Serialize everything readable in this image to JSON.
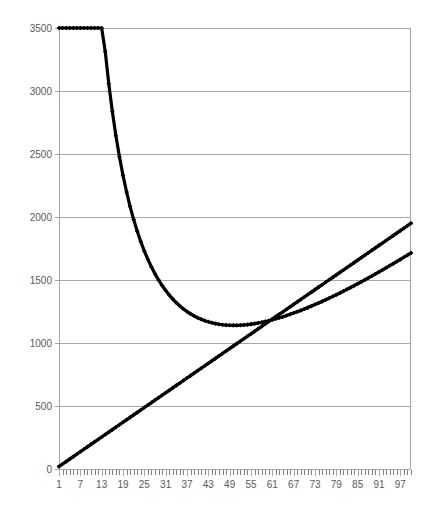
{
  "chart_data": {
    "type": "line",
    "title": "",
    "subtitle": "",
    "xlabel": "",
    "ylabel": "",
    "grid": "horizontal",
    "legend": "none",
    "xlim": [
      1,
      100
    ],
    "ylim": [
      0,
      3500
    ],
    "x_tick_labels": [
      "1",
      "7",
      "13",
      "19",
      "25",
      "31",
      "37",
      "43",
      "49",
      "55",
      "61",
      "67",
      "73",
      "79",
      "85",
      "91",
      "97"
    ],
    "x_tick_values": [
      1,
      7,
      13,
      19,
      25,
      31,
      37,
      43,
      49,
      55,
      61,
      67,
      73,
      79,
      85,
      91,
      97
    ],
    "x_minor_tick_step": 1,
    "y_tick_labels": [
      "0",
      "500",
      "1000",
      "1500",
      "2000",
      "2500",
      "3000",
      "3500"
    ],
    "y_tick_values": [
      0,
      500,
      1000,
      1500,
      2000,
      2500,
      3000,
      3500
    ],
    "marker_style": "filled-diamond",
    "series": [
      {
        "name": "total-cost-curve",
        "color": "#000000",
        "shape": "convex",
        "formula": "y = 23.2*x + 58500/x - 1190",
        "x_start": 1,
        "x_end": 100,
        "x_step": 1,
        "notable_points": {
          "start": {
            "x": 1,
            "y": 3000
          },
          "minimum": {
            "x": 49,
            "y": 520
          },
          "end": {
            "x": 100,
            "y": 2800
          }
        }
      },
      {
        "name": "linear-cost-line",
        "color": "#000000",
        "shape": "linear",
        "formula": "y = 19.5*x",
        "x_start": 1,
        "x_end": 100,
        "x_step": 1,
        "notable_points": {
          "start": {
            "x": 1,
            "y": 20
          },
          "end": {
            "x": 100,
            "y": 1950
          }
        }
      }
    ],
    "intersections": [
      {
        "x": 36,
        "y": 700
      },
      {
        "x": 85,
        "y": 1660
      }
    ]
  },
  "style": {
    "background": "#ffffff",
    "grid_color": "#a6a6a6",
    "axis_color": "#a6a6a6",
    "label_color": "#595959",
    "series_color": "#000000"
  }
}
